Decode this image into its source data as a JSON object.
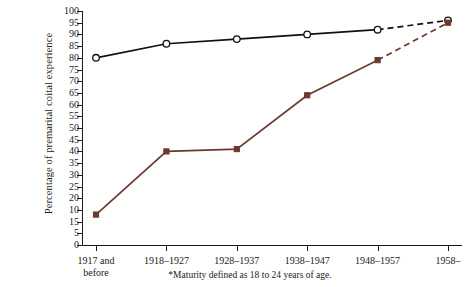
{
  "chart_data": {
    "type": "line",
    "title": "",
    "xlabel": "",
    "ylabel": "Percentage of premarital coital experience",
    "categories": [
      "1917 and\nbefore",
      "1918–1927",
      "1928–1937",
      "1938–1947",
      "1948–1957",
      "1958–"
    ],
    "ylim": [
      0,
      100
    ],
    "ytick_step": 5,
    "ytick_labels": [
      "100",
      "95",
      "90",
      "85",
      "80",
      "75",
      "70",
      "65",
      "60",
      "55",
      "50",
      "45",
      "40",
      "35",
      "30",
      "25",
      "20",
      "10",
      "15",
      "5",
      "0"
    ],
    "ytick_values": [
      100,
      95,
      90,
      85,
      80,
      75,
      70,
      65,
      60,
      55,
      50,
      45,
      40,
      35,
      30,
      25,
      20,
      15,
      10,
      5,
      0
    ],
    "grid": false,
    "legend": "none",
    "series": [
      {
        "name": "upper-series",
        "values": [
          80,
          86,
          88,
          90,
          92,
          96
        ],
        "color": "#111111",
        "marker": "open-circle",
        "dashed_from_index": 4
      },
      {
        "name": "lower-series",
        "values": [
          13,
          40,
          41,
          64,
          79,
          95
        ],
        "color": "#6b3a2e",
        "marker": "filled-square",
        "dashed_from_index": 4
      }
    ],
    "footnote": "*Maturity defined as 18 to 24 years of age."
  }
}
